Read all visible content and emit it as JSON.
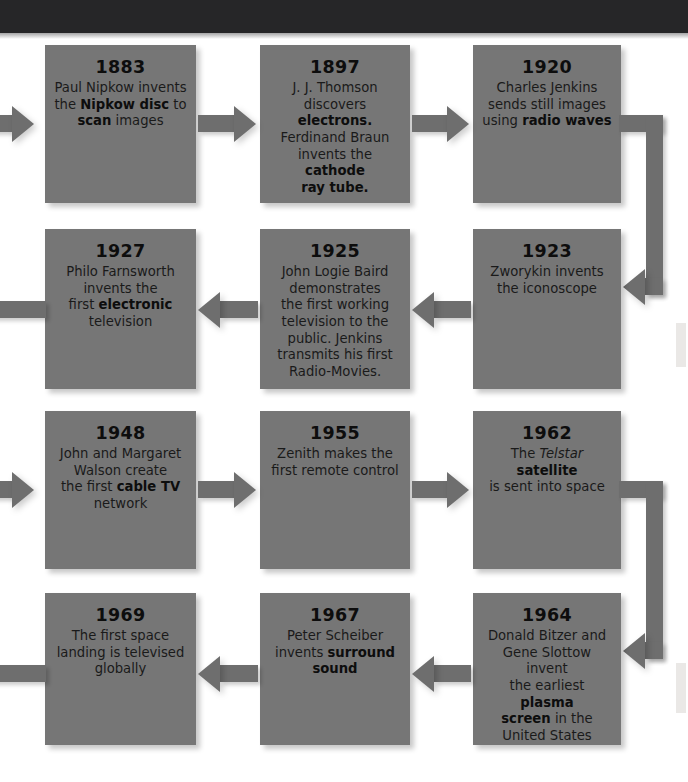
{
  "page": {
    "colors": {
      "top_band": "#262628",
      "node_fill": "#767676",
      "connector": "#6e6e6e",
      "text": "#1a1a1a",
      "background": "#ffffff"
    }
  },
  "timeline": {
    "rows": [
      {
        "direction": "left-to-right",
        "nodes": [
          {
            "year": "1883",
            "text_plain": "Paul Nipkow invents the Nipkow disc to scan images",
            "text_html": "Paul Nipkow invents<br>the <b>Nipkow disc</b> to<br><b>scan</b> images"
          },
          {
            "year": "1897",
            "text_plain": "J. J. Thomson discovers electrons. Ferdinand Braun invents the cathode ray tube.",
            "text_html": "J. J. Thomson<br>discovers <b>electrons.</b><br>Ferdinand Braun<br>invents the <b>cathode</b><br><b>ray tube.</b>"
          },
          {
            "year": "1920",
            "text_plain": "Charles Jenkins sends still images using radio waves",
            "text_html": "Charles Jenkins<br>sends still images<br>using <b>radio waves</b>"
          }
        ]
      },
      {
        "direction": "right-to-left",
        "nodes": [
          {
            "year": "1927",
            "text_plain": "Philo Farnsworth invents the first electronic television",
            "text_html": "Philo Farnsworth<br>invents the<br>first <b>electronic</b><br>television"
          },
          {
            "year": "1925",
            "text_plain": "John Logie Baird demonstrates the first working television to the public. Jenkins transmits his first Radio-Movies.",
            "text_html": "John Logie Baird<br>demonstrates<br>the first working<br>television to the<br>public. Jenkins<br>transmits his first<br>Radio-Movies."
          },
          {
            "year": "1923",
            "text_plain": "Zworykin invents the iconoscope",
            "text_html": "Zworykin invents<br>the iconoscope"
          }
        ]
      },
      {
        "direction": "left-to-right",
        "nodes": [
          {
            "year": "1948",
            "text_plain": "John and Margaret Walson create the first cable TV network",
            "text_html": "John and Margaret<br>Walson create<br>the first <b>cable TV</b><br>network"
          },
          {
            "year": "1955",
            "text_plain": "Zenith makes the first remote control",
            "text_html": "Zenith makes the<br>first remote control"
          },
          {
            "year": "1962",
            "text_plain": "The Telstar satellite is sent into space",
            "text_html": "The <i>Telstar</i> <b>satellite</b><br>is sent into space"
          }
        ]
      },
      {
        "direction": "right-to-left",
        "nodes": [
          {
            "year": "1969",
            "text_plain": "The first space landing is televised globally",
            "text_html": "The first space<br>landing is televised<br>globally"
          },
          {
            "year": "1967",
            "text_plain": "Peter Scheiber invents surround sound",
            "text_html": "Peter Scheiber<br>invents <b>surround</b><br><b>sound</b>"
          },
          {
            "year": "1964",
            "text_plain": "Donald Bitzer and Gene Slottow invent the earliest plasma screen in the United States",
            "text_html": "Donald Bitzer and<br>Gene Slottow invent<br>the earliest <b>plasma</b><br><b>screen</b> in the<br>United States"
          }
        ]
      }
    ]
  }
}
